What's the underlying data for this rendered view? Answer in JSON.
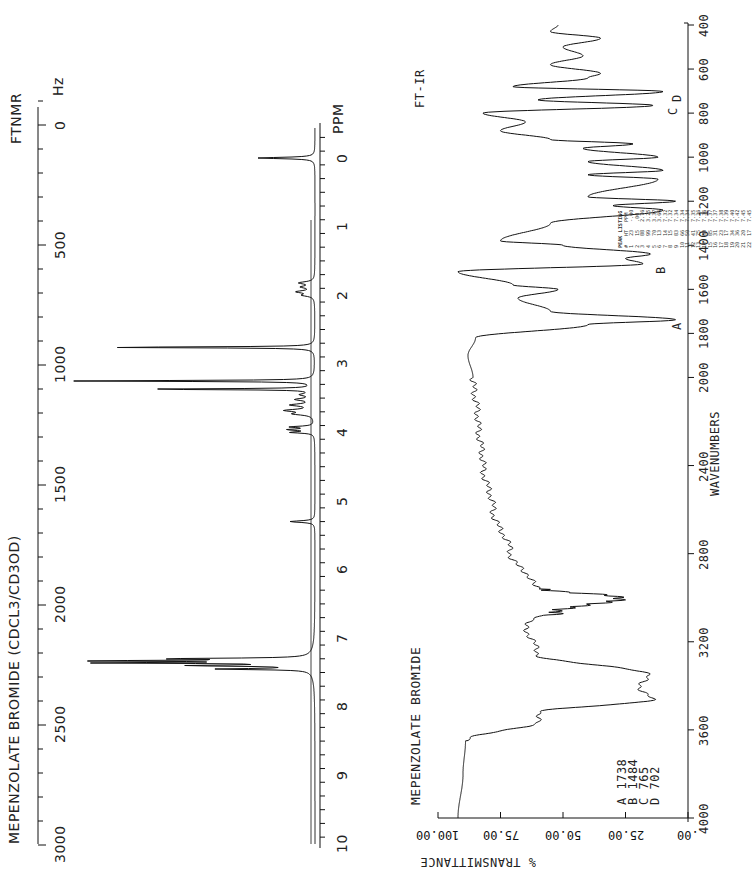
{
  "nmr": {
    "title": "MEPENZOLATE BROMIDE (CDCL3/CD3OD)",
    "instrument": "FTNMR",
    "hz_unit": "Hz",
    "ppm_unit": "PPM",
    "hz_ticks": [
      "0",
      "500",
      "1000",
      "1500",
      "2000",
      "2500",
      "3000"
    ],
    "ppm_ticks": [
      "0",
      "1",
      "2",
      "3",
      "4",
      "5",
      "6",
      "7",
      "8",
      "9",
      "10"
    ],
    "peak_listing": {
      "title": "PEAK LISTING",
      "headers": [
        "#",
        "HT",
        "PPM"
      ],
      "rows": [
        [
          "1",
          "23",
          "-.00"
        ],
        [
          "2",
          "15",
          ".00"
        ],
        [
          "3",
          "88",
          "2.76"
        ],
        [
          "4",
          "99",
          "3.25"
        ],
        [
          "5",
          "70",
          "3.37"
        ],
        [
          "6",
          "13",
          "3.66"
        ],
        [
          "7",
          "14",
          "7.32"
        ],
        [
          "8",
          "15",
          "7.32"
        ],
        [
          "9",
          "83",
          "7.34"
        ],
        [
          "10",
          "66",
          "7.34"
        ],
        [
          "11",
          "50",
          "7.34"
        ],
        [
          "12",
          "41",
          "7.35"
        ],
        [
          "13",
          "75",
          "7.36"
        ],
        [
          "14",
          "80",
          "7.36"
        ],
        [
          "15",
          "85",
          "7.37"
        ],
        [
          "16",
          "31",
          "7.37"
        ],
        [
          "17",
          "23",
          "7.38"
        ],
        [
          "18",
          "17",
          "7.39"
        ],
        [
          "19",
          "34",
          "7.40"
        ],
        [
          "20",
          "36",
          "7.42"
        ],
        [
          "21",
          "20",
          "7.45"
        ],
        [
          "22",
          "17",
          "7.45"
        ]
      ]
    }
  },
  "ir": {
    "title": "MEPENZOLATE BROMIDE",
    "instrument": "FT-IR",
    "xlabel": "WAVENUMBERS",
    "ylabel": "% TRANSMITTANCE",
    "x_ticks": [
      "400",
      "600",
      "800",
      "1000",
      "1200",
      "1400",
      "1600",
      "1800",
      "2000",
      "2400",
      "2800",
      "3200",
      "3600",
      "4000"
    ],
    "y_ticks": [
      ".00",
      "25.00",
      "50.00",
      "75.00",
      "100.00"
    ],
    "peak_labels": [
      {
        "label": "A",
        "value": "1738"
      },
      {
        "label": "B",
        "value": "1484"
      },
      {
        "label": "C",
        "value": "765"
      },
      {
        "label": "D",
        "value": "702"
      }
    ]
  },
  "chart_data": [
    {
      "type": "line",
      "title": "MEPENZOLATE BROMIDE (CDCL3/CD3OD) FTNMR",
      "xlabel": "PPM",
      "ylabel": "Intensity",
      "xlim": [
        0,
        10
      ],
      "secondary_axis": {
        "label": "Hz",
        "range": [
          0,
          3000
        ]
      },
      "peaks": [
        {
          "ppm": 0.0,
          "height": 23,
          "note": "TMS"
        },
        {
          "ppm": 2.76,
          "height": 88
        },
        {
          "ppm": 3.25,
          "height": 99
        },
        {
          "ppm": 3.37,
          "height": 70
        },
        {
          "ppm": 3.66,
          "height": 13
        },
        {
          "ppm": 7.32,
          "height": 15
        },
        {
          "ppm": 7.34,
          "height": 83
        },
        {
          "ppm": 7.36,
          "height": 80
        },
        {
          "ppm": 7.37,
          "height": 85
        },
        {
          "ppm": 7.45,
          "height": 20
        }
      ],
      "minor_multiplets_ppm": [
        1.9,
        3.5,
        3.95,
        5.3
      ]
    },
    {
      "type": "line",
      "title": "MEPENZOLATE BROMIDE FT-IR",
      "xlabel": "WAVENUMBERS",
      "ylabel": "% TRANSMITTANCE",
      "xlim": [
        4000,
        400
      ],
      "ylim": [
        0,
        100
      ],
      "x": [
        4000,
        3800,
        3650,
        3560,
        3520,
        3460,
        3400,
        3350,
        3260,
        3120,
        3060,
        3000,
        2960,
        2940,
        2800,
        2600,
        2400,
        2200,
        2000,
        1900,
        1820,
        1760,
        1738,
        1700,
        1640,
        1600,
        1580,
        1520,
        1484,
        1460,
        1440,
        1400,
        1380,
        1300,
        1240,
        1220,
        1200,
        1180,
        1100,
        1080,
        1060,
        1020,
        1000,
        960,
        940,
        920,
        880,
        840,
        800,
        765,
        740,
        702,
        680,
        640,
        620,
        580,
        540,
        500,
        460,
        430,
        400
      ],
      "y": [
        92,
        90,
        89,
        60,
        59,
        14,
        20,
        15,
        60,
        65,
        55,
        30,
        60,
        62,
        71,
        78,
        82,
        84,
        86,
        88,
        85,
        40,
        5,
        55,
        68,
        52,
        70,
        92,
        18,
        25,
        15,
        50,
        75,
        55,
        10,
        30,
        5,
        40,
        12,
        40,
        10,
        40,
        12,
        42,
        22,
        55,
        75,
        65,
        82,
        14,
        60,
        10,
        70,
        40,
        35,
        55,
        42,
        50,
        35,
        55,
        52
      ],
      "annotations": [
        {
          "label": "A",
          "wavenumber": 1738
        },
        {
          "label": "B",
          "wavenumber": 1484
        },
        {
          "label": "C",
          "wavenumber": 765
        },
        {
          "label": "D",
          "wavenumber": 702
        }
      ]
    }
  ]
}
